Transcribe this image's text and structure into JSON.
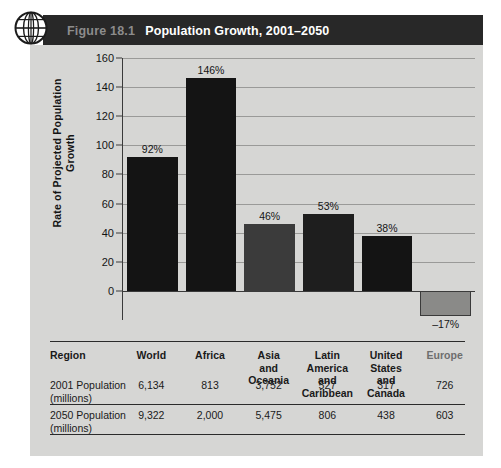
{
  "figure": {
    "number_label": "Figure 18.1",
    "title": "Population Growth, 2001–2050",
    "icon": "globe-icon"
  },
  "colors": {
    "banner_bg": "#282828",
    "panel_bg": "#d6d6d4",
    "bar_dark": "#141414",
    "bar_mid": "#3b3b3b",
    "bar_light": "#8a8a88",
    "gridline": "#9a9a98",
    "axis": "#3a3a3a",
    "fig_num_text": "#8c8c8c",
    "title_text": "#ffffff"
  },
  "chart_data": {
    "type": "bar",
    "title": "Population Growth, 2001–2050",
    "xlabel": "",
    "ylabel": "Rate of Projected Population Growth",
    "ylim": [
      -20,
      160
    ],
    "yticks": [
      0,
      20,
      40,
      60,
      80,
      100,
      120,
      140,
      160
    ],
    "ytick_labels": [
      "0",
      "20",
      "40",
      "60",
      "80",
      "100",
      "120",
      "140",
      "160"
    ],
    "grid": true,
    "legend": "none",
    "categories": [
      "World",
      "Africa",
      "Asia and Oceania",
      "Latin America and Caribbean",
      "United States and Canada",
      "Europe"
    ],
    "values": [
      92,
      146,
      46,
      53,
      38,
      -17
    ],
    "data_labels": [
      "92%",
      "146%",
      "46%",
      "53%",
      "38%",
      "–17%"
    ],
    "bar_colors": [
      "#141414",
      "#141414",
      "#3b3b3b",
      "#1e1e1e",
      "#141414",
      "#8a8a88"
    ]
  },
  "table": {
    "row_labels": [
      "Region",
      "2001 Population\n(millions)",
      "2050 Population\n(millions)"
    ],
    "columns": [
      "World",
      "Africa",
      "Asia\nand\nOceania",
      "Latin\nAmerica\nand\nCaribbean",
      "United\nStates\nand\nCanada",
      "Europe"
    ],
    "population_2001": [
      "6,134",
      "813",
      "3,752",
      "527",
      "317",
      "726"
    ],
    "population_2050": [
      "9,322",
      "2,000",
      "5,475",
      "806",
      "438",
      "603"
    ]
  }
}
